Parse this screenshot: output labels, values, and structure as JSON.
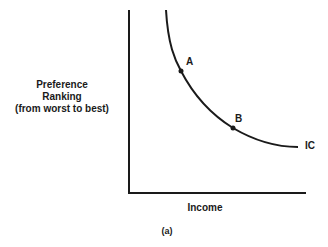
{
  "diagram": {
    "y_axis_label": {
      "line1": "Preference",
      "line2": "Ranking",
      "line3": "(from worst to best)"
    },
    "x_axis_label": "Income",
    "caption": "(a)",
    "curve_label": "IC",
    "points": [
      {
        "label": "A"
      },
      {
        "label": "B"
      }
    ]
  }
}
